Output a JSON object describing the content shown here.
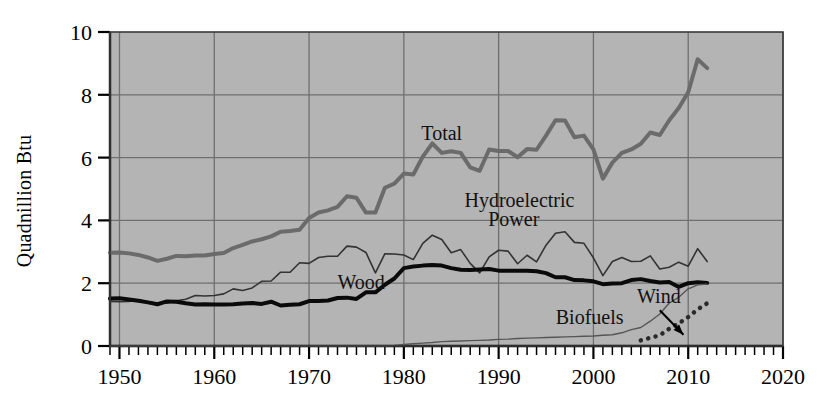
{
  "chart_data": {
    "type": "line",
    "title": "",
    "subtitle": "",
    "xlabel": "",
    "ylabel": "Quadnillion Btu",
    "xlim": [
      1949,
      2020
    ],
    "ylim": [
      0,
      10
    ],
    "xticks": [
      1950,
      1960,
      1970,
      1980,
      1990,
      2000,
      2010,
      2020
    ],
    "xtick_labels": [
      "1950",
      "1960",
      "1970",
      "1980",
      "1990",
      "2000",
      "2010",
      "2020"
    ],
    "yticks": [
      0,
      2,
      4,
      6,
      8,
      10
    ],
    "ytick_labels": [
      "0",
      "2",
      "4",
      "6",
      "8",
      "10"
    ],
    "x_minor_tick_interval": 1,
    "grid": true,
    "grid_color": "#6f6f6f",
    "plot_background": "#b4b4b4",
    "legend": "inline-annotations",
    "annotations": [
      {
        "text": "Total",
        "x": 1984.0,
        "y": 6.55,
        "series": "Total"
      },
      {
        "text": "Hydroelectric",
        "x": 1992.2,
        "y": 4.42,
        "series": "Hydroelectric Power"
      },
      {
        "text": "Power",
        "x": 1991.6,
        "y": 3.82,
        "series": "Hydroelectric Power"
      },
      {
        "text": "Wood",
        "x": 1975.5,
        "y": 1.82,
        "series": "Wood"
      },
      {
        "text": "Biofuels",
        "x": 1999.6,
        "y": 0.7,
        "series": "Biofuels"
      },
      {
        "text": "Wind",
        "x": 2006.9,
        "y": 1.36,
        "series": "Wind"
      }
    ],
    "arrow": {
      "from_x": 2007.0,
      "from_y": 1.14,
      "to_x": 2009.5,
      "to_y": 0.36,
      "points_to": "Wind"
    },
    "x": [
      1949,
      1950,
      1951,
      1952,
      1953,
      1954,
      1955,
      1956,
      1957,
      1958,
      1959,
      1960,
      1961,
      1962,
      1963,
      1964,
      1965,
      1966,
      1967,
      1968,
      1969,
      1970,
      1971,
      1972,
      1973,
      1974,
      1975,
      1976,
      1977,
      1978,
      1979,
      1980,
      1981,
      1982,
      1983,
      1984,
      1985,
      1986,
      1987,
      1988,
      1989,
      1990,
      1991,
      1992,
      1993,
      1994,
      1995,
      1996,
      1997,
      1998,
      1999,
      2000,
      2001,
      2002,
      2003,
      2004,
      2005,
      2006,
      2007,
      2008,
      2009,
      2010,
      2011,
      2012
    ],
    "series": [
      {
        "name": "Total",
        "style": "thick-gray-line",
        "color": "#6b6b6b",
        "width": 4,
        "values": [
          2.97,
          2.98,
          2.95,
          2.9,
          2.82,
          2.71,
          2.78,
          2.87,
          2.86,
          2.88,
          2.88,
          2.93,
          2.96,
          3.12,
          3.22,
          3.33,
          3.4,
          3.49,
          3.64,
          3.66,
          3.7,
          4.08,
          4.25,
          4.32,
          4.43,
          4.77,
          4.72,
          4.25,
          4.25,
          5.04,
          5.17,
          5.49,
          5.46,
          6.03,
          6.45,
          6.15,
          6.2,
          6.15,
          5.69,
          5.58,
          6.26,
          6.21,
          6.21,
          6.01,
          6.27,
          6.25,
          6.7,
          7.19,
          7.18,
          6.65,
          6.7,
          6.26,
          5.33,
          5.84,
          6.15,
          6.26,
          6.44,
          6.8,
          6.72,
          7.19,
          7.58,
          8.08,
          9.13,
          8.85
        ]
      },
      {
        "name": "Hydroelectric Power",
        "style": "thin-dark-line",
        "color": "#333333",
        "width": 1.6,
        "values": [
          1.42,
          1.41,
          1.42,
          1.47,
          1.41,
          1.36,
          1.36,
          1.44,
          1.49,
          1.61,
          1.59,
          1.61,
          1.66,
          1.82,
          1.77,
          1.85,
          2.06,
          2.07,
          2.35,
          2.35,
          2.65,
          2.63,
          2.82,
          2.86,
          2.86,
          3.18,
          3.15,
          2.98,
          2.33,
          2.94,
          2.93,
          2.9,
          2.75,
          3.27,
          3.53,
          3.39,
          2.97,
          3.07,
          2.63,
          2.33,
          2.84,
          3.05,
          3.02,
          2.62,
          2.89,
          2.68,
          3.21,
          3.59,
          3.64,
          3.3,
          3.27,
          2.81,
          2.24,
          2.69,
          2.82,
          2.69,
          2.7,
          2.87,
          2.45,
          2.51,
          2.67,
          2.54,
          3.1,
          2.69
        ]
      },
      {
        "name": "Wood",
        "style": "thick-black-line",
        "color": "#0a0a0a",
        "width": 4,
        "values": [
          1.51,
          1.52,
          1.48,
          1.44,
          1.39,
          1.33,
          1.42,
          1.41,
          1.36,
          1.32,
          1.33,
          1.32,
          1.32,
          1.33,
          1.35,
          1.37,
          1.34,
          1.41,
          1.29,
          1.31,
          1.33,
          1.43,
          1.43,
          1.45,
          1.53,
          1.54,
          1.5,
          1.71,
          1.71,
          1.95,
          2.15,
          2.48,
          2.53,
          2.56,
          2.58,
          2.56,
          2.48,
          2.43,
          2.42,
          2.44,
          2.45,
          2.4,
          2.4,
          2.4,
          2.4,
          2.38,
          2.32,
          2.19,
          2.19,
          2.1,
          2.09,
          2.06,
          1.97,
          1.99,
          2.0,
          2.1,
          2.13,
          2.07,
          2.02,
          2.04,
          1.88,
          2.0,
          2.03,
          2.01
        ]
      },
      {
        "name": "Biofuels",
        "style": "thin-gray-line",
        "color": "#555555",
        "width": 1.4,
        "values": [
          0,
          0,
          0,
          0,
          0,
          0,
          0,
          0,
          0,
          0,
          0,
          0,
          0,
          0,
          0,
          0,
          0,
          0,
          0,
          0,
          0,
          0,
          0,
          0,
          0,
          0,
          0,
          0,
          0,
          0,
          0.02,
          0.05,
          0.07,
          0.09,
          0.11,
          0.14,
          0.15,
          0.16,
          0.17,
          0.18,
          0.19,
          0.21,
          0.22,
          0.24,
          0.25,
          0.26,
          0.27,
          0.28,
          0.29,
          0.3,
          0.31,
          0.32,
          0.34,
          0.36,
          0.42,
          0.52,
          0.59,
          0.79,
          1.02,
          1.37,
          1.55,
          1.82,
          1.95,
          1.97
        ]
      },
      {
        "name": "Wind",
        "style": "dotted-dark-line",
        "color": "#2a2a2a",
        "width": 4.5,
        "values": [
          null,
          null,
          null,
          null,
          null,
          null,
          null,
          null,
          null,
          null,
          null,
          null,
          null,
          null,
          null,
          null,
          null,
          null,
          null,
          null,
          null,
          null,
          null,
          null,
          null,
          null,
          null,
          null,
          null,
          null,
          null,
          null,
          null,
          null,
          null,
          null,
          null,
          null,
          null,
          null,
          null,
          null,
          null,
          null,
          null,
          null,
          null,
          null,
          null,
          null,
          null,
          null,
          null,
          null,
          null,
          null,
          0.18,
          0.26,
          0.34,
          0.55,
          0.72,
          0.92,
          1.17,
          1.36
        ]
      }
    ]
  },
  "axis": {
    "y_axis_title": "Quadnillion Btu"
  }
}
